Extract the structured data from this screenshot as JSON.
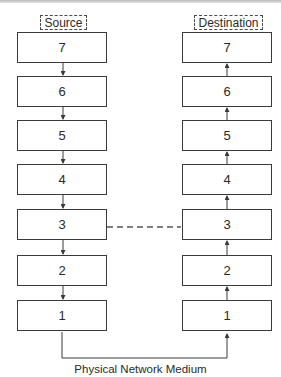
{
  "diagram": {
    "source_label": "Source",
    "destination_label": "Destination",
    "source_layers": [
      "7",
      "6",
      "5",
      "4",
      "3",
      "2",
      "1"
    ],
    "destination_layers": [
      "7",
      "6",
      "5",
      "4",
      "3",
      "2",
      "1"
    ],
    "source_flow": "down",
    "destination_flow": "up",
    "peer_link": {
      "from_layer": "3",
      "to_layer": "3",
      "style": "dashed"
    },
    "medium_label": "Physical Network Medium",
    "colors": {
      "line": "#3a3a3a",
      "text": "#2a2a2a",
      "dashed": "#555555"
    }
  }
}
